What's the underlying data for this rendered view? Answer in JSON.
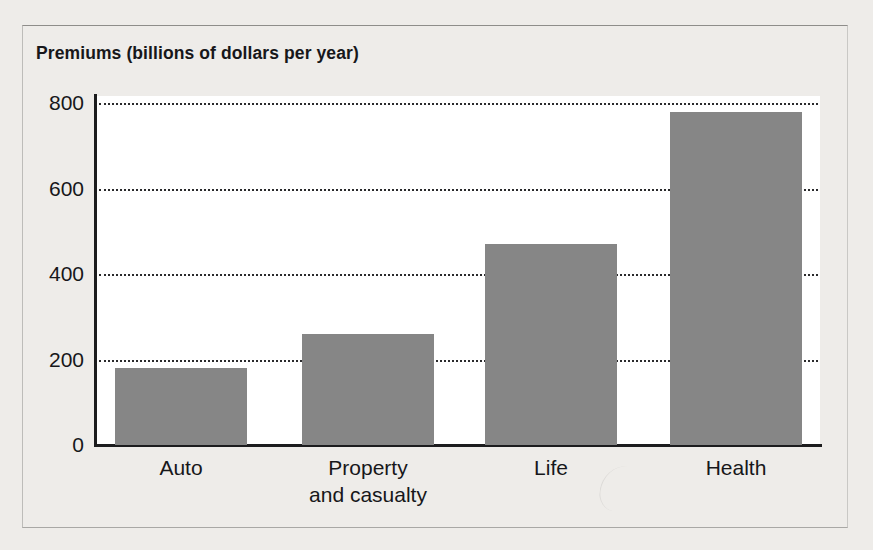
{
  "chart_data": {
    "type": "bar",
    "title": "Premiums (billions of dollars per year)",
    "xlabel": "",
    "ylabel": "Premiums (billions of dollars per year)",
    "categories": [
      "Auto",
      "Property and casualty",
      "Life",
      "Health"
    ],
    "category_lines": [
      [
        "Auto"
      ],
      [
        "Property",
        "and casualty"
      ],
      [
        "Life"
      ],
      [
        "Health"
      ]
    ],
    "values": [
      180,
      260,
      470,
      780
    ],
    "ylim": [
      0,
      800
    ],
    "yticks": [
      0,
      200,
      400,
      600,
      800
    ],
    "ytick_labels": [
      "0",
      "200",
      "400",
      "600",
      "800"
    ],
    "grid": "horizontal-dotted",
    "legend": "none",
    "bar_color": "#868686",
    "plot_background": "#ffffff",
    "page_background": "#eeece9",
    "axis_color": "#1c1c1e"
  },
  "figure": {
    "title": "Premiums (billions of dollars per year)",
    "y_ticks": [
      {
        "label": "800",
        "value": 800
      },
      {
        "label": "600",
        "value": 600
      },
      {
        "label": "400",
        "value": 400
      },
      {
        "label": "200",
        "value": 200
      },
      {
        "label": "0",
        "value": 0
      }
    ],
    "bars": [
      {
        "label_line1": "Auto",
        "label_line2": "",
        "value": 180
      },
      {
        "label_line1": "Property",
        "label_line2": "and casualty",
        "value": 260
      },
      {
        "label_line1": "Life",
        "label_line2": "",
        "value": 470
      },
      {
        "label_line1": "Health",
        "label_line2": "",
        "value": 780
      }
    ]
  }
}
